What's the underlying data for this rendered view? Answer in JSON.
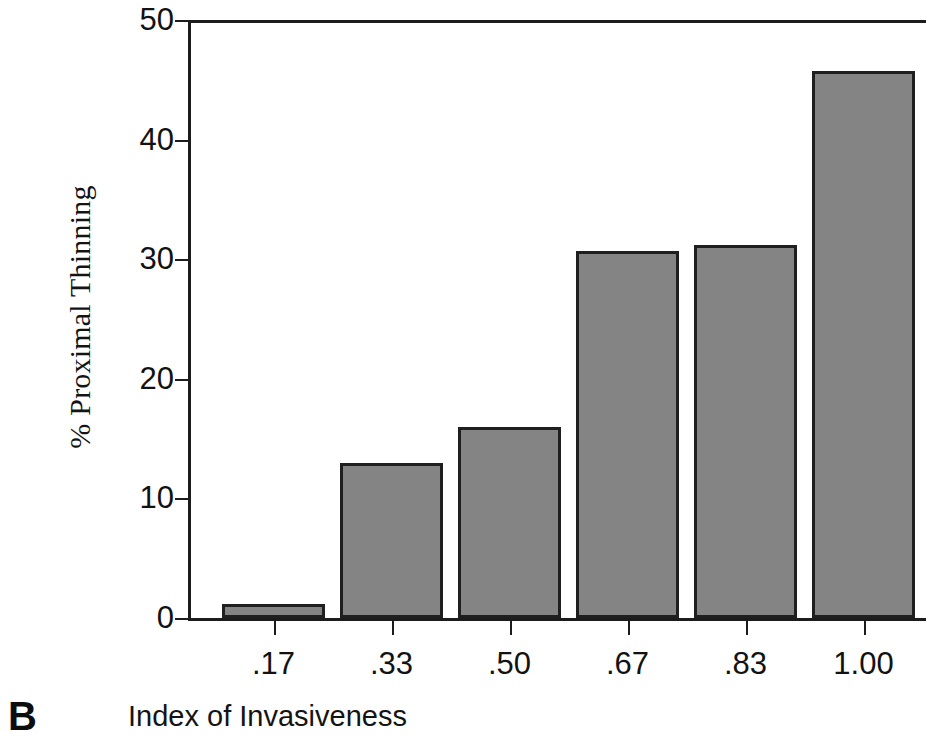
{
  "panel": {
    "letter": "B"
  },
  "chart_data": {
    "type": "bar",
    "title": "",
    "subtitle": "",
    "xlabel": "Index of Invasiveness",
    "ylabel": "% Proximal Thinning",
    "categories": [
      ".17",
      ".33",
      ".50",
      ".67",
      ".83",
      "1.00"
    ],
    "values": [
      1.2,
      13.0,
      16.0,
      30.7,
      31.2,
      45.7
    ],
    "series": [
      {
        "name": "% Proximal Thinning",
        "values": [
          1.2,
          13.0,
          16.0,
          30.7,
          31.2,
          45.7
        ]
      }
    ],
    "ylim": [
      0,
      50
    ],
    "yticks": [
      0,
      10,
      20,
      30,
      40,
      50
    ],
    "ytick_labels": [
      "0",
      "10",
      "20",
      "30",
      "40",
      "50"
    ],
    "xtick_labels": [
      ".17",
      ".33",
      ".50",
      ".67",
      ".83",
      "1.00"
    ],
    "grid": false,
    "legend": false,
    "legend_position": "none",
    "bar_fill_color": "#848484",
    "bar_edge_color": "#1f1f1f",
    "axis_color": "#1c1c1c",
    "background_color": "#ffffff"
  }
}
